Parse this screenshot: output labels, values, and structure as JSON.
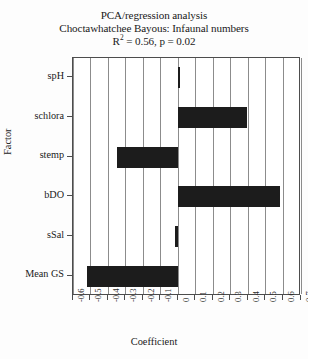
{
  "chart_data": {
    "type": "bar",
    "orientation": "horizontal",
    "title": "PCA/regression analysis",
    "subtitle": "Choctawhatchee Bayous: Infaunal numbers",
    "stat_line_prefix": "R",
    "stat_line_sup": "2",
    "stat_line_rest": " = 0.56, p = 0.02",
    "xlabel": "Coefficient",
    "ylabel": "Factor",
    "categories": [
      "spH",
      "schlora",
      "stemp",
      "bDO",
      "sSal",
      "Mean GS"
    ],
    "values": [
      0.0,
      0.39,
      -0.35,
      0.58,
      -0.02,
      -0.52
    ],
    "xlim": [
      -0.6,
      0.7
    ],
    "xticks": [
      -0.6,
      -0.5,
      -0.4,
      -0.3,
      -0.2,
      -0.1,
      0,
      0.1,
      0.2,
      0.3,
      0.4,
      0.5,
      0.6,
      0.7
    ],
    "xtick_labels": [
      "-0.6",
      "-0.5",
      "-0.4",
      "-0.3",
      "-0.2",
      "-0.1",
      "0",
      "0.1",
      "0.2",
      "0.3",
      "0.4",
      "0.5",
      "0.6",
      "0.7"
    ],
    "grid": "vertical",
    "legend": "none",
    "bar_color": "#1c1c1c",
    "grid_color": "#8c8c8c",
    "frame_color": "#4d4d4d",
    "background": "#ffffff"
  }
}
